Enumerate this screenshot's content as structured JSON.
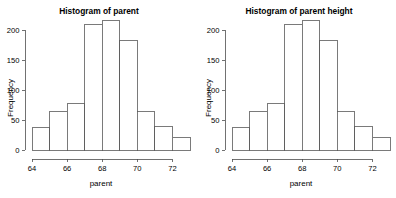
{
  "page": {
    "background_color": "#ffffff",
    "width": 396,
    "height": 198,
    "panel_count": 2
  },
  "colors": {
    "background": "#ffffff",
    "axis": "#4d4d4d",
    "bar_stroke": "#595959",
    "bar_fill": "#ffffff",
    "text": "#000000"
  },
  "chart_data": [
    {
      "type": "bar",
      "subtype": "histogram",
      "title": "Histogram of parent",
      "xlabel": "parent",
      "ylabel": "Frequency",
      "categories": [
        "64-65",
        "65-66",
        "66-67",
        "67-68",
        "68-69",
        "69-70",
        "70-71",
        "71-72",
        "72-73"
      ],
      "bin_edges": [
        64,
        65,
        66,
        67,
        68,
        69,
        70,
        71,
        72,
        73
      ],
      "values": [
        37,
        64,
        77,
        209,
        216,
        182,
        64,
        40,
        21
      ],
      "xlim": [
        64,
        73
      ],
      "ylim": [
        0,
        216
      ],
      "xticks": [
        64,
        66,
        68,
        70,
        72
      ],
      "xtick_labels": [
        "64",
        "66",
        "68",
        "70",
        "72"
      ],
      "yticks": [
        0,
        50,
        100,
        150,
        200
      ],
      "ytick_labels": [
        "0",
        "50",
        "100",
        "150",
        "200"
      ],
      "grid": false,
      "legend": false
    },
    {
      "type": "bar",
      "subtype": "histogram",
      "title": "Histogram of parent height",
      "xlabel": "parent",
      "ylabel": "Frequency",
      "categories": [
        "64-65",
        "65-66",
        "66-67",
        "67-68",
        "68-69",
        "69-70",
        "70-71",
        "71-72",
        "72-73"
      ],
      "bin_edges": [
        64,
        65,
        66,
        67,
        68,
        69,
        70,
        71,
        72,
        73
      ],
      "values": [
        37,
        64,
        77,
        209,
        216,
        182,
        64,
        40,
        21
      ],
      "xlim": [
        64,
        73
      ],
      "ylim": [
        0,
        216
      ],
      "xticks": [
        64,
        66,
        68,
        70,
        72
      ],
      "xtick_labels": [
        "64",
        "66",
        "68",
        "70",
        "72"
      ],
      "yticks": [
        0,
        50,
        100,
        150,
        200
      ],
      "ytick_labels": [
        "0",
        "50",
        "100",
        "150",
        "200"
      ],
      "grid": false,
      "legend": false
    }
  ]
}
